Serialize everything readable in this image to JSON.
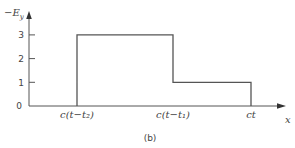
{
  "chart_data": {
    "type": "line",
    "step": true,
    "title": "",
    "caption": "(b)",
    "xlabel": "x",
    "ylabel": "−E_y",
    "ylabel_main": "−E",
    "ylabel_sub": "y",
    "ylim": [
      0,
      3.3
    ],
    "yticks": [
      0,
      1,
      2,
      3
    ],
    "ytick_labels": [
      "0",
      "1",
      "2",
      "3"
    ],
    "xtick_labels": [
      "c(t−t₂)",
      "c(t−t₁)",
      "ct"
    ],
    "x_positions": [
      0,
      1,
      2,
      3
    ],
    "xlim": [
      -1,
      3.4
    ],
    "series": [
      {
        "name": "-Ey",
        "segments": [
          {
            "from": "c(t−t₂)",
            "to": "c(t−t₁)",
            "value": 3
          },
          {
            "from": "c(t−t₁)",
            "to": "ct",
            "value": 1
          }
        ],
        "points": [
          [
            -1,
            0
          ],
          [
            0,
            0
          ],
          [
            0,
            3
          ],
          [
            1.81,
            3
          ],
          [
            1.81,
            1
          ],
          [
            3.26,
            1
          ],
          [
            3.26,
            0
          ]
        ]
      }
    ],
    "grid": false,
    "legend": "none"
  }
}
